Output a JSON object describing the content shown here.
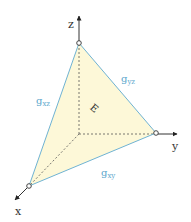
{
  "diagram": {
    "axes": {
      "x": {
        "label": "x"
      },
      "y": {
        "label": "y"
      },
      "z": {
        "label": "z"
      }
    },
    "face_label": "E",
    "edges": {
      "xz": {
        "label": "g",
        "sub": "xz"
      },
      "yz": {
        "label": "g",
        "sub": "yz"
      },
      "xy": {
        "label": "g",
        "sub": "xy"
      }
    },
    "colors": {
      "face_fill": "#fdf8d8",
      "edge_stroke": "#6fb3d3",
      "edge_label": "#5aa6cc",
      "axis": "#333333",
      "dashed": "#555555"
    }
  }
}
